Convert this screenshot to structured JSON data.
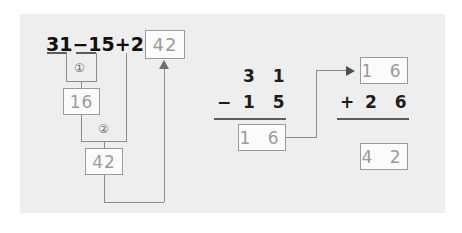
{
  "worksheet": {
    "expression": {
      "full": "31−15+26=",
      "operand_1": "31",
      "operator_1": "−",
      "operand_2": "15",
      "operator_2": "+",
      "operand_3": "26",
      "equals": "="
    },
    "answer_box": "42",
    "steps": [
      {
        "marker": "①",
        "result": "16"
      },
      {
        "marker": "②",
        "result": "42"
      }
    ],
    "step_boxes": {
      "step1_result": "16",
      "step2_result": "42"
    },
    "column_subtraction": {
      "minuend": "3 1",
      "operator": "−",
      "subtrahend": "1 5",
      "difference": "1 6"
    },
    "column_addition": {
      "addend_1": "1 6",
      "operator": "+",
      "addend_2": "2 6",
      "sum": "4 2"
    },
    "colors": {
      "panel_background": "#eeeeee",
      "page_background": "#ffffff",
      "box_border": "#9a9a9a",
      "box_fill": "#fbfbfb",
      "boxed_text": "#9b9b9b",
      "ink": "#1d1d1d",
      "connector": "#8d8d8d"
    }
  }
}
